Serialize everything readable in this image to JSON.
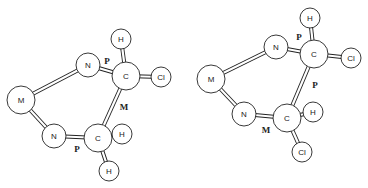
{
  "diagram": {
    "molecules": [
      {
        "id": "left",
        "atoms": [
          {
            "label": "M",
            "x": 21,
            "y": 100,
            "r": 14
          },
          {
            "label": "N",
            "x": 88,
            "y": 65,
            "r": 12
          },
          {
            "label": "N",
            "x": 54,
            "y": 136,
            "r": 12
          },
          {
            "label": "C",
            "x": 126,
            "y": 76,
            "r": 14
          },
          {
            "label": "C",
            "x": 98,
            "y": 138,
            "r": 14
          },
          {
            "label": "H",
            "x": 121,
            "y": 39,
            "r": 10
          },
          {
            "label": "Cl",
            "x": 161,
            "y": 77,
            "r": 10
          },
          {
            "label": "H",
            "x": 122,
            "y": 134,
            "r": 10
          },
          {
            "label": "H",
            "x": 109,
            "y": 171,
            "r": 10
          }
        ],
        "bonds": [
          [
            0,
            1
          ],
          [
            0,
            2
          ],
          [
            1,
            3
          ],
          [
            2,
            4
          ],
          [
            3,
            4
          ],
          [
            3,
            5
          ],
          [
            3,
            6
          ],
          [
            4,
            7
          ],
          [
            4,
            8
          ]
        ],
        "bond_labels": [
          {
            "text": "P",
            "x": 107,
            "y": 61
          },
          {
            "text": "M",
            "x": 124,
            "y": 107
          },
          {
            "text": "P",
            "x": 77,
            "y": 149
          }
        ]
      },
      {
        "id": "right",
        "atoms": [
          {
            "label": "M",
            "x": 211,
            "y": 79,
            "r": 14
          },
          {
            "label": "N",
            "x": 276,
            "y": 47,
            "r": 12
          },
          {
            "label": "N",
            "x": 244,
            "y": 114,
            "r": 12
          },
          {
            "label": "C",
            "x": 314,
            "y": 54,
            "r": 14
          },
          {
            "label": "C",
            "x": 287,
            "y": 118,
            "r": 14
          },
          {
            "label": "H",
            "x": 310,
            "y": 18,
            "r": 10
          },
          {
            "label": "Cl",
            "x": 351,
            "y": 58,
            "r": 10
          },
          {
            "label": "H",
            "x": 313,
            "y": 112,
            "r": 10
          },
          {
            "label": "Cl",
            "x": 302,
            "y": 152,
            "r": 10
          }
        ],
        "bonds": [
          [
            0,
            1
          ],
          [
            0,
            2
          ],
          [
            1,
            3
          ],
          [
            2,
            4
          ],
          [
            3,
            4
          ],
          [
            3,
            5
          ],
          [
            3,
            6
          ],
          [
            4,
            7
          ],
          [
            4,
            8
          ]
        ],
        "bond_labels": [
          {
            "text": "P",
            "x": 299,
            "y": 37
          },
          {
            "text": "P",
            "x": 315,
            "y": 85
          },
          {
            "text": "M",
            "x": 266,
            "y": 130
          }
        ]
      }
    ]
  }
}
